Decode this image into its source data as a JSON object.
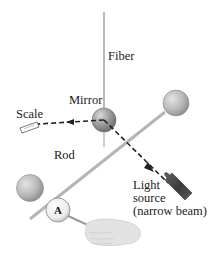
{
  "diagram": {
    "labels": {
      "fiber": "Fiber",
      "mirror": "Mirror",
      "scale": "Scale",
      "rod": "Rod",
      "light_source_line1": "Light",
      "light_source_line2": "source",
      "light_source_line3": "(narrow beam)",
      "sphere_a": "A"
    },
    "colors": {
      "sphere_fill": "#b9b9b9",
      "sphere_dark": "#8d8d8d",
      "rod": "#b5b5b5",
      "fiber": "#8a8a8a",
      "beam": "#222222",
      "light_source": "#4a4a4a",
      "hand": "#dcdcdc"
    }
  }
}
